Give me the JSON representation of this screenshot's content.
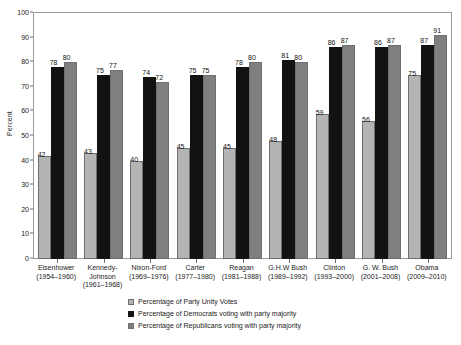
{
  "chart_data": {
    "type": "bar",
    "title": "",
    "xlabel": "",
    "ylabel": "Percent",
    "ylim": [
      0,
      100
    ],
    "ytick_step": 10,
    "yticks": [
      0,
      10,
      20,
      30,
      40,
      50,
      60,
      70,
      80,
      90,
      100
    ],
    "grid": false,
    "legend_position": "bottom-center",
    "categories": [
      "Eisenhower (1954–1960)",
      "Kennedy-Johnson (1961–1968)",
      "Nixon-Ford (1969–1976)",
      "Carter (1977–1980)",
      "Reagan (1981–1988)",
      "G.H.W Bush (1989–1992)",
      "Clinton (1993–2000)",
      "G. W. Bush (2001–2008)",
      "Obama (2009–2010)"
    ],
    "category_lines": [
      [
        "Eisenhower",
        "(1954–1960)",
        ""
      ],
      [
        "Kennedy-",
        "Johnson",
        "(1961–1968)"
      ],
      [
        "Nixon-Ford",
        "(1969–1976)",
        ""
      ],
      [
        "Carter",
        "(1977–1980)",
        ""
      ],
      [
        "Reagan",
        "(1981–1988)",
        ""
      ],
      [
        "G.H.W Bush",
        "(1989–1992)",
        ""
      ],
      [
        "Clinton",
        "(1993–2000)",
        ""
      ],
      [
        "G. W. Bush",
        "(2001–2008)",
        ""
      ],
      [
        "Obama",
        "(2009–2010)",
        ""
      ]
    ],
    "series": [
      {
        "name": "Percentage of Party Unity Votes",
        "color": "#b4b4b4",
        "values": [
          42,
          43,
          40,
          45,
          45,
          48,
          59,
          56,
          75
        ]
      },
      {
        "name": "Percentage of Democrats voting with party majority",
        "color": "#121212",
        "values": [
          78,
          75,
          74,
          75,
          78,
          81,
          86,
          86,
          87
        ]
      },
      {
        "name": "Percentage of Republicans voting with party majority",
        "color": "#7f7f7f",
        "values": [
          80,
          77,
          72,
          75,
          80,
          80,
          87,
          87,
          91
        ]
      }
    ]
  },
  "axis": {
    "y_title": "Percent"
  },
  "legend": {
    "items": [
      {
        "label": "Percentage of Party Unity Votes",
        "swatch": "sw-unity"
      },
      {
        "label": "Percentage of Democrats voting with party majority",
        "swatch": "sw-dem"
      },
      {
        "label": "Percentage of Republicans voting with party majority",
        "swatch": "sw-rep"
      }
    ]
  }
}
